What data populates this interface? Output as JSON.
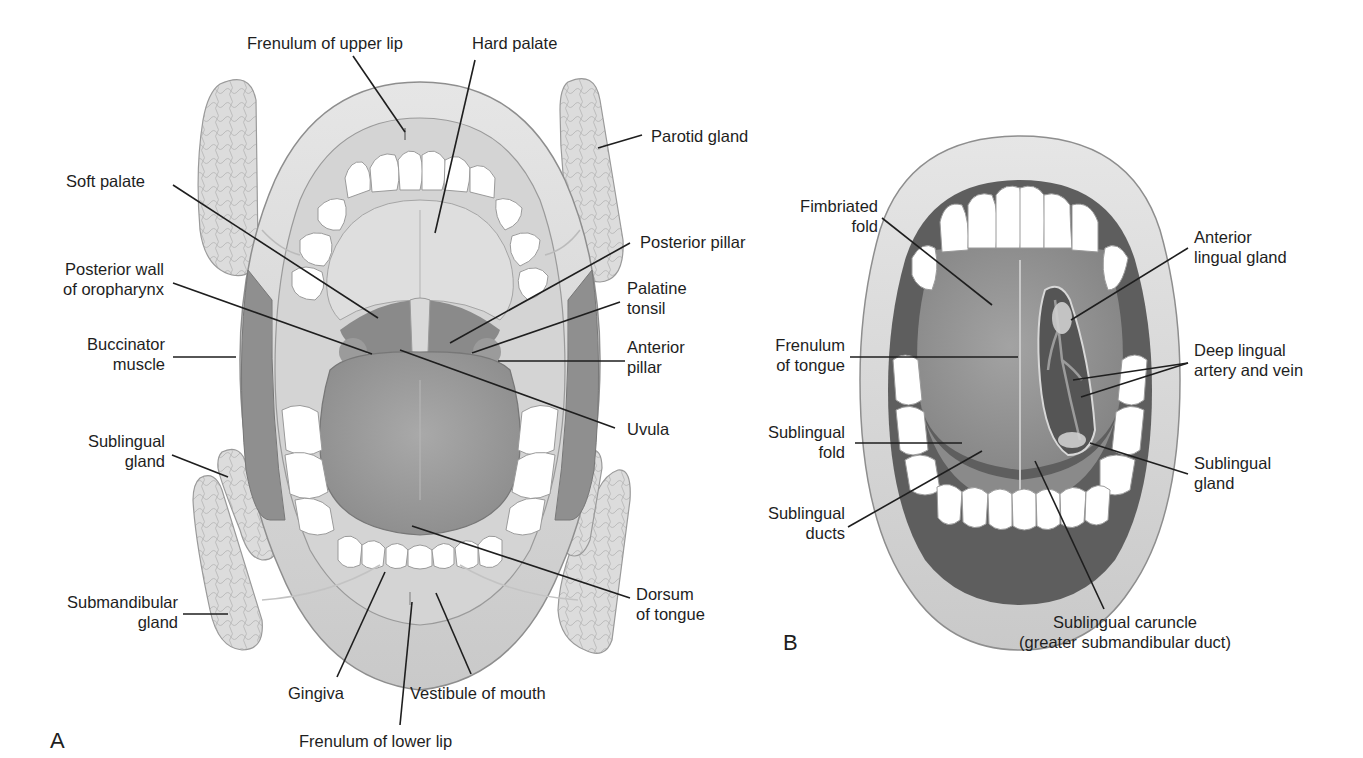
{
  "figure": {
    "panel_a": {
      "letter": "A",
      "labels": {
        "frenulum_upper_lip": "Frenulum of upper lip",
        "hard_palate": "Hard palate",
        "parotid_gland": "Parotid gland",
        "soft_palate": "Soft palate",
        "posterior_pillar": "Posterior pillar",
        "posterior_wall_1": "Posterior wall",
        "posterior_wall_2": "of oropharynx",
        "palatine_tonsil_1": "Palatine",
        "palatine_tonsil_2": "tonsil",
        "buccinator_1": "Buccinator",
        "buccinator_2": "muscle",
        "anterior_pillar_1": "Anterior",
        "anterior_pillar_2": "pillar",
        "uvula": "Uvula",
        "sublingual_gland_1": "Sublingual",
        "sublingual_gland_2": "gland",
        "dorsum_1": "Dorsum",
        "dorsum_2": "of tongue",
        "submandibular_1": "Submandibular",
        "submandibular_2": "gland",
        "gingiva": "Gingiva",
        "vestibule": "Vestibule of mouth",
        "frenulum_lower_lip": "Frenulum of lower lip"
      }
    },
    "panel_b": {
      "letter": "B",
      "labels": {
        "fimbriated_1": "Fimbriated",
        "fimbriated_2": "fold",
        "anterior_lingual_1": "Anterior",
        "anterior_lingual_2": "lingual gland",
        "frenulum_tongue_1": "Frenulum",
        "frenulum_tongue_2": "of tongue",
        "deep_lingual_1": "Deep lingual",
        "deep_lingual_2": "artery and vein",
        "sublingual_fold_1": "Sublingual",
        "sublingual_fold_2": "fold",
        "sublingual_gland_1": "Sublingual",
        "sublingual_gland_2": "gland",
        "sublingual_ducts_1": "Sublingual",
        "sublingual_ducts_2": "ducts",
        "caruncle_1": "Sublingual caruncle",
        "caruncle_2": "(greater submandibular duct)"
      }
    }
  }
}
